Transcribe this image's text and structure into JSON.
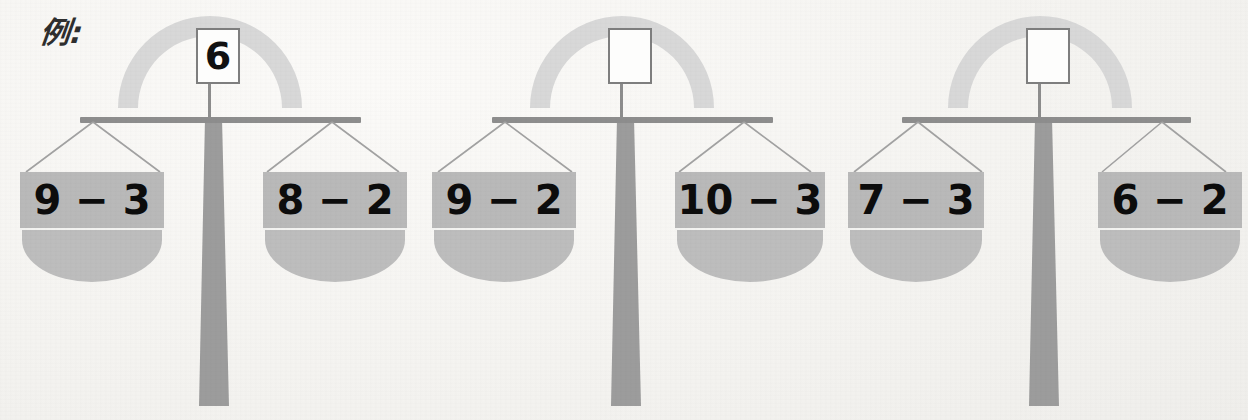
{
  "page": {
    "example_label": "例:",
    "background_color": "#f6f5f3",
    "pan_color": "#b8b8b8",
    "pan_bowl_color": "#bdbdbd",
    "beam_color": "#8e8e8e",
    "stand_color": "#9a9a9a",
    "arc_color": "#d6d6d6",
    "text_color": "#0c0c0c",
    "box_border_color": "#7e7e7e"
  },
  "scales": [
    {
      "id": "scale-1",
      "is_example": true,
      "answer": "6",
      "answer_is_blank": false,
      "left_pan": {
        "expression": "9 − 3",
        "value": 6
      },
      "right_pan": {
        "expression": "8 − 2",
        "value": 6
      }
    },
    {
      "id": "scale-2",
      "is_example": false,
      "answer": "",
      "answer_is_blank": true,
      "left_pan": {
        "expression": "9 − 2",
        "value": 7
      },
      "right_pan": {
        "expression": "10 − 3",
        "value": 7
      }
    },
    {
      "id": "scale-3",
      "is_example": false,
      "answer": "",
      "answer_is_blank": true,
      "left_pan": {
        "expression": "7 − 3",
        "value": 4
      },
      "right_pan": {
        "expression": "6 − 2",
        "value": 4
      }
    }
  ]
}
